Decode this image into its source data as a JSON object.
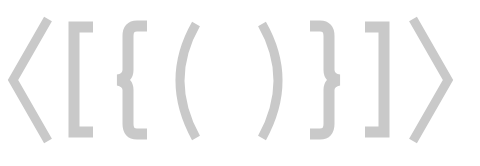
{
  "image": {
    "description": "Row of light gray bracket glyphs on white",
    "glyph_color": "#c9c9c9",
    "background": "#ffffff",
    "glyphs": [
      {
        "name": "left-angle-bracket",
        "char": "〈"
      },
      {
        "name": "left-square-bracket",
        "char": "["
      },
      {
        "name": "left-curly-brace",
        "char": "{"
      },
      {
        "name": "left-parenthesis",
        "char": "("
      },
      {
        "name": "right-parenthesis",
        "char": ")"
      },
      {
        "name": "right-curly-brace",
        "char": "}"
      },
      {
        "name": "right-square-bracket",
        "char": "]"
      },
      {
        "name": "right-angle-bracket",
        "char": "〉"
      }
    ]
  }
}
